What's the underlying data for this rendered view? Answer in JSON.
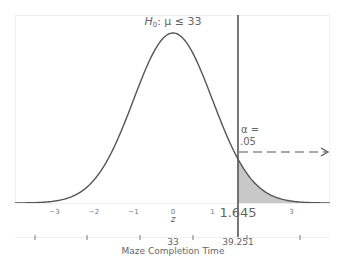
{
  "chart_data": {
    "type": "area",
    "title_parts": {
      "h": "H",
      "sub": "0",
      "rest": ": μ ≤ 33"
    },
    "distribution": "standard normal",
    "xlabel": "z",
    "x2label": "Maze Completion Time",
    "z_ticks": [
      -3,
      -2,
      -1,
      0,
      1,
      3
    ],
    "z_tick_labels": [
      "−3",
      "−2",
      "−1",
      "0",
      "1",
      "3"
    ],
    "critical_z": 1.645,
    "critical_z_label": "1.645",
    "critical_raw": 39.251,
    "critical_raw_label": "39.251",
    "mean_raw": 33,
    "mean_raw_label": "33",
    "alpha_label_line1": "α =",
    "alpha_label_line2": ".05",
    "alpha": 0.05,
    "shaded_region": "right tail, z > 1.645",
    "arrow": "dashed arrow pointing right from critical line",
    "xlim": [
      -3.5,
      3.8
    ],
    "grid": false,
    "colors": {
      "curve": "#555555",
      "shade": "#c8c8c8",
      "critical_line": "#555555",
      "text": "#666666"
    }
  }
}
